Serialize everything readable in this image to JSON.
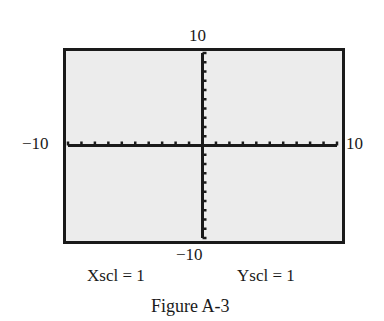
{
  "chart_data": {
    "type": "line",
    "title": "Figure A-3",
    "xmin": -10,
    "xmax": 10,
    "xscl": 1,
    "ymin": -10,
    "ymax": 10,
    "yscl": 1,
    "xlim": [
      -10,
      10
    ],
    "ylim": [
      -10,
      10
    ],
    "grid": false,
    "series": [],
    "tick_labels": {
      "left": "−10",
      "right": "10",
      "top": "10",
      "bottom": "−10"
    }
  },
  "labels": {
    "xmin": "−10",
    "xmax": "10",
    "ymax": "10",
    "ymin": "−10",
    "xscl": "Xscl = 1",
    "yscl": "Yscl = 1",
    "caption": "Figure A-3"
  },
  "colors": {
    "screen": "#ececec",
    "ink": "#1a1a1a"
  }
}
